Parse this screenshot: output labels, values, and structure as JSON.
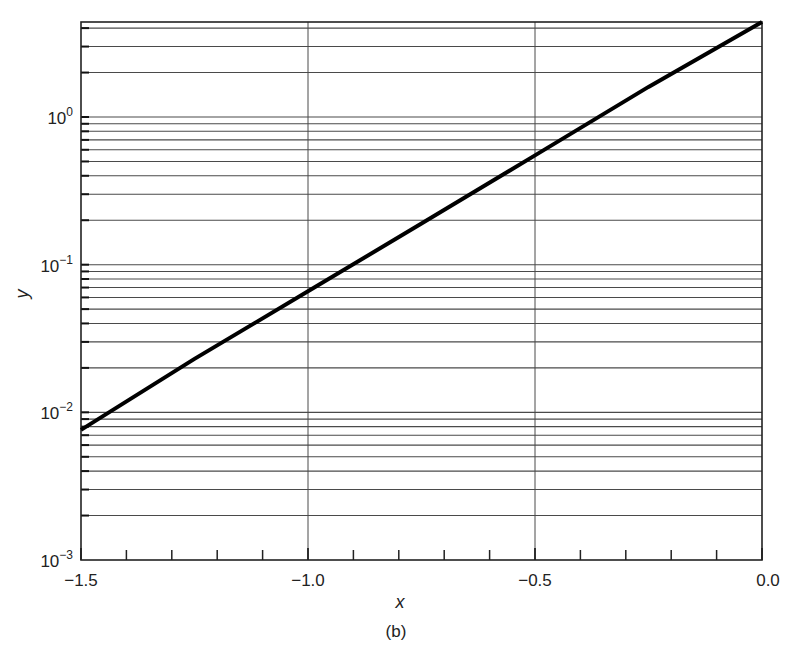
{
  "chart_data": {
    "type": "line",
    "title": "",
    "caption": "(b)",
    "xlabel": "x",
    "ylabel": "y",
    "xscale": "linear",
    "yscale": "log",
    "xlim": [
      -1.5,
      0.0
    ],
    "ylim": [
      0.001,
      4.4
    ],
    "grid": true,
    "x_ticks": [
      -1.5,
      -1.0,
      -0.5,
      0.0
    ],
    "x_tick_labels": [
      "−1.5",
      "−1.0",
      "−0.5",
      "0.0"
    ],
    "x_minor_ticks": [
      -1.4,
      -1.3,
      -1.2,
      -1.1,
      -0.9,
      -0.8,
      -0.7,
      -0.6,
      -0.4,
      -0.3,
      -0.2,
      -0.1
    ],
    "y_ticks": [
      0.001,
      0.01,
      0.1,
      1
    ],
    "y_tick_labels": [
      {
        "base": "10",
        "exp": "−3"
      },
      {
        "base": "10",
        "exp": "−2"
      },
      {
        "base": "10",
        "exp": "−1"
      },
      {
        "base": "10",
        "exp": "0"
      }
    ],
    "series": [
      {
        "name": "y",
        "color": "#000000",
        "x": [
          -1.5,
          -1.25,
          -1.0,
          -0.75,
          -0.5,
          -0.25,
          0.0
        ],
        "y": [
          0.0076,
          0.023,
          0.066,
          0.19,
          0.55,
          1.6,
          4.4
        ]
      }
    ]
  },
  "colors": {
    "grid": "#4a4a4a",
    "axis": "#222222",
    "line": "#000000",
    "background": "#ffffff"
  }
}
